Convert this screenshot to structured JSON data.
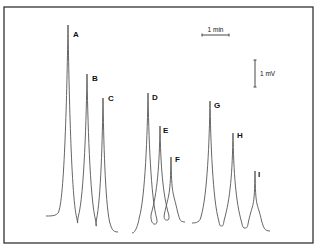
{
  "chart_data": {
    "type": "line",
    "title": "",
    "xlabel": "",
    "ylabel": "",
    "grid": false,
    "legend": "none",
    "scale_bars": {
      "time": {
        "label": "1 min",
        "x1": 202,
        "x2": 229,
        "y": 35
      },
      "signal": {
        "label": "1 mV",
        "x": 255,
        "y1": 60,
        "y2": 87
      }
    },
    "colors": {
      "trace": "#555555",
      "frame": "#333333",
      "label": "#111111"
    },
    "traces": [
      {
        "name": "trace-1",
        "baseline_start": [
          46,
          216
        ],
        "baseline_end": [
          118,
          232
        ],
        "peaks": [
          {
            "label": "A",
            "x": 68,
            "apex_y": 25,
            "valley_y": 214,
            "width": 4,
            "relative_height": 1.0,
            "label_pos": [
              73,
              37
            ]
          },
          {
            "label": "B",
            "x": 87,
            "apex_y": 74,
            "valley_y": 221,
            "width": 4,
            "relative_height": 0.77,
            "label_pos": [
              92,
              81
            ]
          },
          {
            "label": "C",
            "x": 103,
            "apex_y": 98,
            "valley_y": 224,
            "width": 3,
            "relative_height": 0.66,
            "label_pos": [
              108,
              101
            ]
          }
        ]
      },
      {
        "name": "trace-2",
        "baseline_start": [
          132,
          233
        ],
        "baseline_end": [
          185,
          222
        ],
        "peaks": [
          {
            "label": "D",
            "x": 148,
            "apex_y": 93,
            "valley_y": 222,
            "width": 4,
            "relative_height": 0.68,
            "label_pos": [
              152,
              100
            ]
          },
          {
            "label": "E",
            "x": 160,
            "apex_y": 126,
            "valley_y": 218,
            "width": 4,
            "relative_height": 0.52,
            "label_pos": [
              163,
              133
            ]
          },
          {
            "label": "F",
            "x": 171,
            "apex_y": 157,
            "valley_y": 218,
            "width": 3,
            "relative_height": 0.38,
            "label_pos": [
              175,
              162
            ]
          }
        ]
      },
      {
        "name": "trace-3",
        "baseline_start": [
          192,
          223
        ],
        "baseline_end": [
          270,
          231
        ],
        "peaks": [
          {
            "label": "G",
            "x": 210,
            "apex_y": 101,
            "valley_y": 220,
            "width": 4,
            "relative_height": 0.62,
            "label_pos": [
              214,
              108
            ]
          },
          {
            "label": "H",
            "x": 233,
            "apex_y": 133,
            "valley_y": 224,
            "width": 4,
            "relative_height": 0.47,
            "label_pos": [
              237,
              138
            ]
          },
          {
            "label": "I",
            "x": 255,
            "apex_y": 171,
            "valley_y": 226,
            "width": 3,
            "relative_height": 0.29,
            "label_pos": [
              258,
              177
            ]
          }
        ]
      }
    ]
  }
}
